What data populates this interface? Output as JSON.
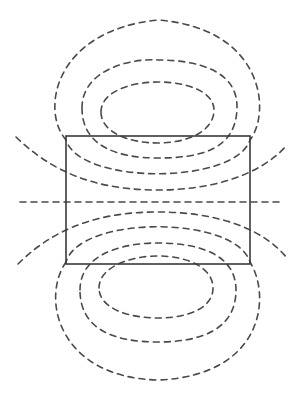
{
  "diagram": {
    "title": "",
    "colors": {
      "field_line": "#4a4a4a",
      "body_outline": "#3a3a3a",
      "background": "#ffffff"
    },
    "body": {
      "shape": "rectangle",
      "x": 66,
      "y": 136,
      "width": 184,
      "height": 128
    },
    "axis_line": {
      "style": "dashed",
      "x1": 20,
      "y1": 202,
      "x2": 284,
      "y2": 202
    },
    "field_loops_top": 3,
    "field_loops_bottom": 3,
    "open_field_lines_top": 1,
    "open_field_lines_bottom": 1
  }
}
